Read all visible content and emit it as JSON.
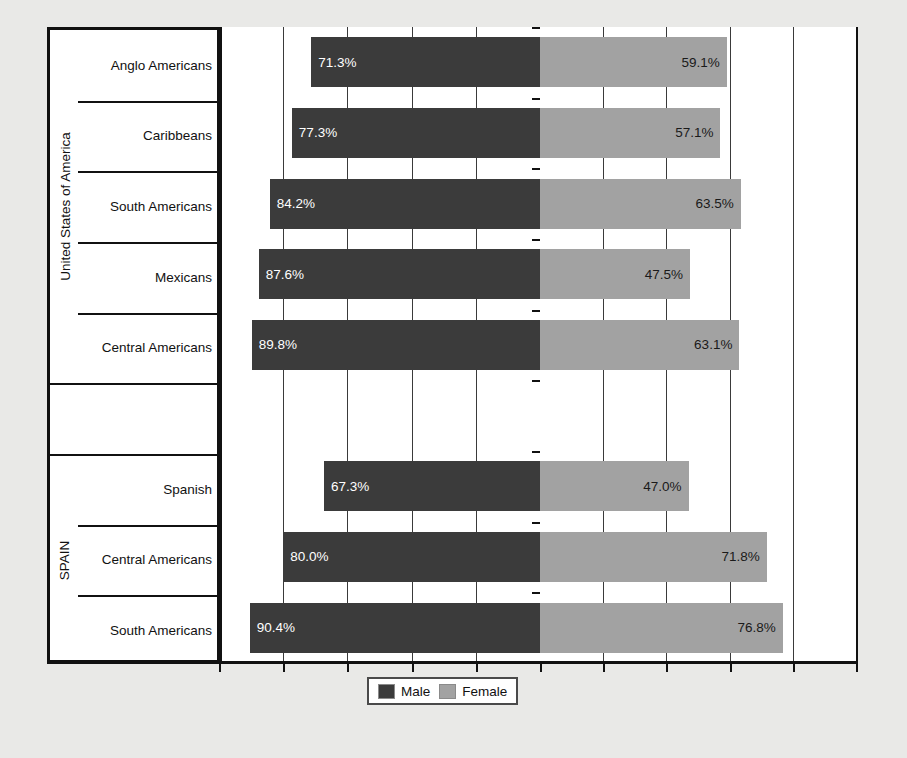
{
  "chart_data": {
    "type": "bar",
    "subtype": "diverging-horizontal-bar",
    "title": "",
    "xlabel": "",
    "ylabel": "",
    "grid": true,
    "legend_position": "bottom",
    "series": [
      {
        "name": "Male",
        "color": "#3b3b3b",
        "direction": "left",
        "values": [
          71.3,
          77.3,
          84.2,
          87.6,
          89.8,
          null,
          67.3,
          80.0,
          90.4
        ]
      },
      {
        "name": "Female",
        "color": "#a2a2a2",
        "direction": "right",
        "values": [
          59.1,
          57.1,
          63.5,
          47.5,
          63.1,
          null,
          47.0,
          71.8,
          76.8
        ]
      }
    ],
    "categories": [
      "Anglo Americans",
      "Caribbeans",
      "South Americans",
      "Mexicans",
      "Central Americans",
      "",
      "Spanish",
      "Central Americans",
      "South Americans"
    ],
    "value_labels": {
      "male": [
        "71.3%",
        "77.3%",
        "84.2%",
        "87.6%",
        "89.8%",
        "",
        "67.3%",
        "80.0%",
        "90.4%"
      ],
      "female": [
        "59.1%",
        "57.1%",
        "63.5%",
        "47.5%",
        "63.1%",
        "",
        "47.0%",
        "71.8%",
        "76.8%"
      ]
    },
    "groups": [
      {
        "label": "United States of America",
        "start_index": 0,
        "end_index": 4
      },
      {
        "label": "SPAIN",
        "start_index": 6,
        "end_index": 8
      }
    ],
    "axis_max_left": 100,
    "axis_max_right": 100
  },
  "groups": [
    {
      "label": "United States of America"
    },
    {
      "label": "SPAIN"
    }
  ],
  "rows": [
    {
      "category": "Anglo Americans",
      "male": "71.3%",
      "female": "59.1%"
    },
    {
      "category": "Caribbeans",
      "male": "77.3%",
      "female": "57.1%"
    },
    {
      "category": "South Americans",
      "male": "84.2%",
      "female": "63.5%"
    },
    {
      "category": "Mexicans",
      "male": "87.6%",
      "female": "47.5%"
    },
    {
      "category": "Central Americans",
      "male": "89.8%",
      "female": "63.1%"
    },
    {
      "category": "",
      "male": "",
      "female": ""
    },
    {
      "category": "Spanish",
      "male": "67.3%",
      "female": "47.0%"
    },
    {
      "category": "Central Americans",
      "male": "80.0%",
      "female": "71.8%"
    },
    {
      "category": "South Americans",
      "male": "90.4%",
      "female": "76.8%"
    }
  ],
  "legend": {
    "male_label": "Male",
    "female_label": "Female"
  },
  "colors": {
    "male": "#3b3b3b",
    "female": "#a2a2a2",
    "axis": "#111111",
    "plot_background": "#ffffff",
    "page_background": "#e9e9e7"
  }
}
